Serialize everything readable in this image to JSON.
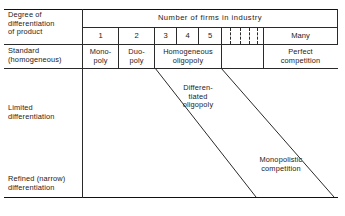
{
  "figure": {
    "title_row": {
      "row_header": "Degree of\ndifferentiation\nof product",
      "axis_title": "Number of firms in industry"
    },
    "firm_counts": [
      "1",
      "2",
      "3",
      "4",
      "5"
    ],
    "many_label": "Many",
    "rows": [
      {
        "label": "Standard\n(homogeneous)",
        "cells": [
          {
            "label": "Mono-\npoly"
          },
          {
            "label": "Duo-\npoly"
          },
          {
            "label": "Homogeneous\noligopoly"
          },
          {
            "label": "Perfect\ncompetition"
          }
        ]
      },
      {
        "label": "Limited\ndifferentiation",
        "cells": []
      },
      {
        "label": "Refined (narrow)\ndifferentiation",
        "cells": []
      }
    ],
    "band_labels": {
      "differentiated_oligopoly": "Differen-\ntiated\noligopoly",
      "monopolistic_competition": "Monopolistic\ncompetition"
    },
    "colors": {
      "line": "#2a2a2a",
      "text": "#1b1b1b",
      "background": "#ffffff"
    }
  }
}
